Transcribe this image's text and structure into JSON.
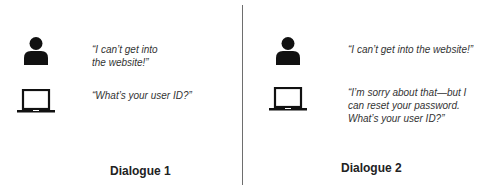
{
  "colors": {
    "icon": "#111111",
    "text": "#333333",
    "divider": "#6e6e6e",
    "background": "#ffffff"
  },
  "dialogues": [
    {
      "caption": "Dialogue 1",
      "turns": [
        {
          "speaker": "user",
          "icon": "person-icon",
          "text": "“I can’t get into the website!”"
        },
        {
          "speaker": "computer",
          "icon": "laptop-icon",
          "text": "“What’s your user ID?”"
        }
      ]
    },
    {
      "caption": "Dialogue 2",
      "turns": [
        {
          "speaker": "user",
          "icon": "person-icon",
          "text": "“I can’t get into the website!”"
        },
        {
          "speaker": "computer",
          "icon": "laptop-icon",
          "text": "“I’m sorry about that—but I can reset your password. What’s your user ID?”"
        }
      ]
    }
  ]
}
